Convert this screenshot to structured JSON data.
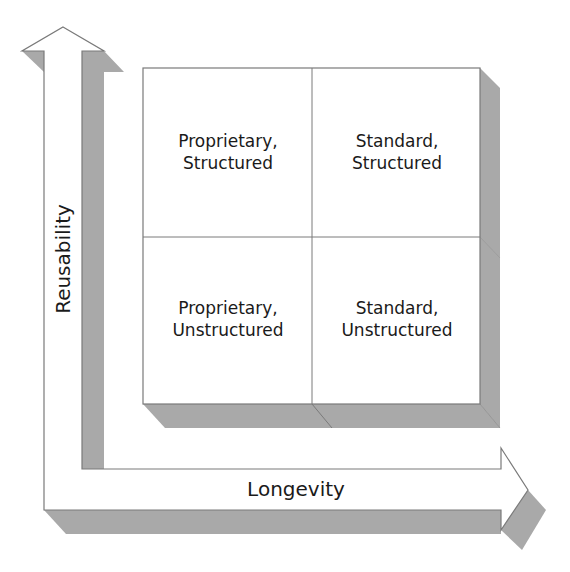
{
  "diagram": {
    "axes": {
      "x_label": "Longevity",
      "y_label": "Reusability"
    },
    "quadrants": [
      {
        "position": "top-left",
        "line1": "Proprietary,",
        "line2": "Structured"
      },
      {
        "position": "top-right",
        "line1": "Standard,",
        "line2": "Structured"
      },
      {
        "position": "bottom-left",
        "line1": "Proprietary,",
        "line2": "Unstructured"
      },
      {
        "position": "bottom-right",
        "line1": "Standard,",
        "line2": "Unstructured"
      }
    ],
    "colors": {
      "shadow": "#a9a9a9",
      "stroke": "#7a7a7a",
      "fill": "#ffffff",
      "text": "#1a1a1a"
    }
  }
}
